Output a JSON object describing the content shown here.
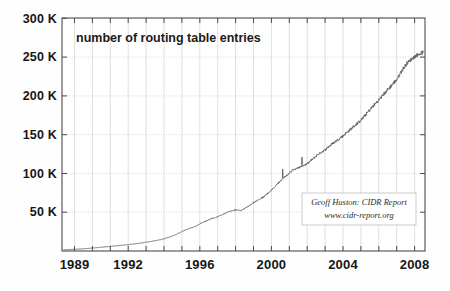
{
  "chart_data": {
    "type": "line",
    "title": "number of routing table entries",
    "xlabel": "",
    "ylabel": "",
    "xlim": [
      1988.3,
      2008.6
    ],
    "ylim": [
      0,
      300000
    ],
    "grid": true,
    "legend_position": "none",
    "y_ticks": [
      50000,
      100000,
      150000,
      200000,
      250000,
      300000
    ],
    "y_tick_labels": [
      "50 K",
      "100 K",
      "150 K",
      "200 K",
      "250 K",
      "300 K"
    ],
    "x_ticks": [
      1989,
      1992,
      1996,
      2000,
      2004,
      2008
    ],
    "x_tick_labels": [
      "1989",
      "1992",
      "1996",
      "2000",
      "2004",
      "2008"
    ],
    "x_minor_tick_step": 1,
    "series": [
      {
        "name": "BGP routing table entries",
        "color": "#555555",
        "x": [
          1988.4,
          1989.0,
          1989.6,
          1990.2,
          1990.8,
          1991.4,
          1992.0,
          1992.6,
          1993.2,
          1993.8,
          1994.2,
          1994.6,
          1995.0,
          1995.4,
          1995.8,
          1996.0,
          1996.3,
          1996.6,
          1997.0,
          1997.3,
          1997.6,
          1998.0,
          1998.3,
          1998.6,
          1999.0,
          1999.3,
          1999.6,
          2000.0,
          2000.3,
          2000.6,
          2001.0,
          2001.2,
          2001.5,
          2001.8,
          2002.0,
          2002.3,
          2002.6,
          2003.0,
          2003.3,
          2003.6,
          2004.0,
          2004.3,
          2004.6,
          2005.0,
          2005.3,
          2005.6,
          2006.0,
          2006.3,
          2006.6,
          2007.0,
          2007.3,
          2007.6,
          2008.0,
          2008.3,
          2008.5
        ],
        "y": [
          1500,
          2200,
          3000,
          4200,
          5500,
          6800,
          8200,
          9800,
          12000,
          14500,
          17000,
          20500,
          25000,
          29000,
          32000,
          35000,
          38000,
          41000,
          44000,
          47000,
          50500,
          53000,
          52000,
          56000,
          62000,
          66000,
          70000,
          78000,
          85000,
          92000,
          100000,
          104000,
          107000,
          110000,
          112000,
          118000,
          124000,
          130000,
          136000,
          141000,
          148000,
          154000,
          160000,
          168000,
          176000,
          184000,
          194000,
          202000,
          210000,
          220000,
          232000,
          242000,
          250000,
          254000,
          256000
        ]
      }
    ],
    "annotations": [
      {
        "name": "credit-box",
        "line1": "Geoff Huston: CIDR Report",
        "line2": "www.cidr-report.org"
      }
    ]
  }
}
